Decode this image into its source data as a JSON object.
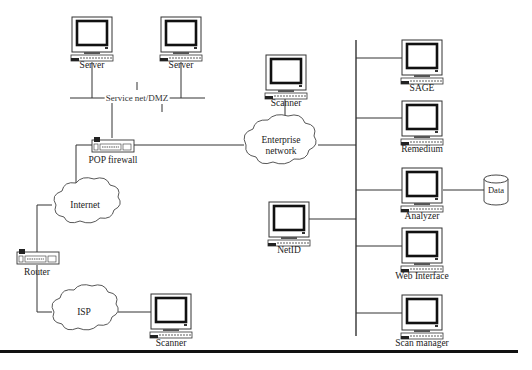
{
  "diagram": {
    "type": "network-topology",
    "bus_label": "Service net/DMZ",
    "nodes": {
      "server1": {
        "label": "Server",
        "kind": "computer"
      },
      "server2": {
        "label": "Server",
        "kind": "computer"
      },
      "pop_firewall": {
        "label": "POP firewall",
        "kind": "network-device"
      },
      "router": {
        "label": "Router",
        "kind": "network-device"
      },
      "internet": {
        "label": "Internet",
        "kind": "cloud"
      },
      "isp": {
        "label": "ISP",
        "kind": "cloud"
      },
      "enterprise": {
        "label": "Enterprise\nnetwork",
        "kind": "cloud"
      },
      "scanner_top": {
        "label": "Scanner",
        "kind": "computer"
      },
      "scanner_bottom": {
        "label": "Scanner",
        "kind": "computer"
      },
      "netid": {
        "label": "NetID",
        "kind": "computer"
      },
      "sage": {
        "label": "SAGE",
        "kind": "computer"
      },
      "remedium": {
        "label": "Remedium",
        "kind": "computer"
      },
      "analyzer": {
        "label": "Analyzer",
        "kind": "computer"
      },
      "web_interface": {
        "label": "Web Interface",
        "kind": "computer"
      },
      "scan_manager": {
        "label": "Scan manager",
        "kind": "computer"
      },
      "data": {
        "label": "Data",
        "kind": "database"
      }
    },
    "edges": [
      [
        "server1",
        "dmz_bus"
      ],
      [
        "server2",
        "dmz_bus"
      ],
      [
        "dmz_bus",
        "pop_firewall"
      ],
      [
        "pop_firewall",
        "enterprise"
      ],
      [
        "pop_firewall",
        "internet"
      ],
      [
        "internet",
        "router"
      ],
      [
        "router",
        "isp"
      ],
      [
        "isp",
        "scanner_bottom"
      ],
      [
        "scanner_top",
        "enterprise"
      ],
      [
        "enterprise",
        "backbone"
      ],
      [
        "netid",
        "backbone"
      ],
      [
        "sage",
        "backbone"
      ],
      [
        "remedium",
        "backbone"
      ],
      [
        "analyzer",
        "backbone"
      ],
      [
        "web_interface",
        "backbone"
      ],
      [
        "scan_manager",
        "backbone"
      ],
      [
        "analyzer",
        "data"
      ]
    ]
  }
}
